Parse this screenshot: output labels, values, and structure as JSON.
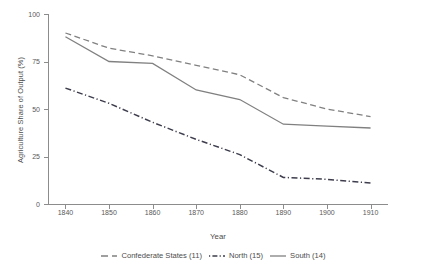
{
  "chart_data": {
    "type": "line",
    "title": "",
    "xlabel": "Year",
    "ylabel": "Agriculture Share of Output (%)",
    "x": [
      1840,
      1850,
      1860,
      1870,
      1880,
      1890,
      1900,
      1910
    ],
    "xtick_labels": [
      "1840",
      "1850",
      "1860",
      "1870",
      "1880",
      "1890",
      "1900",
      "1910"
    ],
    "ytick_labels": [
      "0",
      "25",
      "50",
      "75",
      "100"
    ],
    "ytick_values": [
      0,
      25,
      50,
      75,
      100
    ],
    "xlim": [
      1836,
      1914
    ],
    "ylim": [
      0,
      100
    ],
    "grid": false,
    "legend_position": "bottom",
    "series": [
      {
        "name": "Confederate States (11)",
        "values": [
          90,
          82,
          78,
          73,
          68,
          56,
          50,
          46
        ],
        "style": "dashed",
        "color": "#808080"
      },
      {
        "name": "North (15)",
        "values": [
          61,
          53,
          43,
          34,
          26,
          14,
          13,
          11
        ],
        "style": "dashdot",
        "color": "#3d3d4d"
      },
      {
        "name": "South (14)",
        "values": [
          88,
          75,
          74,
          60,
          55,
          42,
          41,
          40
        ],
        "style": "solid",
        "color": "#808080"
      }
    ]
  },
  "legend": {
    "items": [
      {
        "label": "Confederate States (11)",
        "key": "dashed-line-icon"
      },
      {
        "label": "North (15)",
        "key": "dashdot-line-icon"
      },
      {
        "label": "South (14)",
        "key": "solid-line-icon"
      }
    ]
  },
  "colors": {
    "axis": "#8c8c8c",
    "text": "#4d4d4d",
    "tick_text": "#595959",
    "background": "#ffffff",
    "confederate": "#808080",
    "north": "#3d3d4d",
    "south": "#808080"
  }
}
